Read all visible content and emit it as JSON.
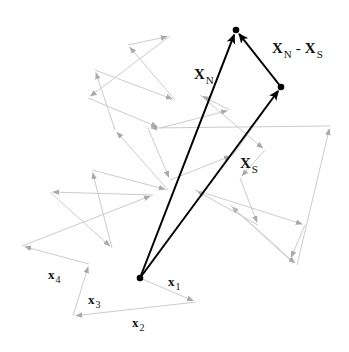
{
  "diagram": {
    "title": "",
    "colors": {
      "walk_step": "#cccccc",
      "walk_arrowhead": "#aaaaaa",
      "vector": "#000000",
      "background": "#ffffff"
    },
    "points": {
      "origin": {
        "x": 140,
        "y": 278
      },
      "end_N": {
        "x": 236,
        "y": 30
      },
      "end_S": {
        "x": 281,
        "y": 87
      }
    },
    "vectors": [
      {
        "id": "X_N",
        "from": "origin",
        "to": "end_N"
      },
      {
        "id": "X_S",
        "from": "origin",
        "to": "end_S"
      },
      {
        "id": "X_N_minus_X_S",
        "from": "end_S",
        "to": "end_N"
      }
    ],
    "labels": {
      "X_N": {
        "main": "X",
        "sub": "N"
      },
      "X_S": {
        "main": "X",
        "sub": "S"
      },
      "diff": {
        "left_main": "X",
        "left_sub": "N",
        "op": "-",
        "right_main": "X",
        "right_sub": "S"
      },
      "x1": {
        "main": "x",
        "sub": "1"
      },
      "x2": {
        "main": "x",
        "sub": "2"
      },
      "x3": {
        "main": "x",
        "sub": "3"
      },
      "x4": {
        "main": "x",
        "sub": "4"
      }
    },
    "random_walk": [
      [
        140,
        278
      ],
      [
        196,
        302
      ],
      [
        73,
        316
      ],
      [
        89,
        264
      ],
      [
        22,
        246
      ],
      [
        153,
        195
      ],
      [
        50,
        192
      ],
      [
        112,
        248
      ],
      [
        92,
        170
      ],
      [
        168,
        190
      ],
      [
        115,
        130
      ],
      [
        95,
        70
      ],
      [
        175,
        100
      ],
      [
        128,
        45
      ],
      [
        170,
        36
      ],
      [
        88,
        98
      ],
      [
        160,
        128
      ],
      [
        230,
        110
      ],
      [
        200,
        95
      ],
      [
        265,
        150
      ],
      [
        240,
        178
      ],
      [
        258,
        225
      ],
      [
        195,
        190
      ],
      [
        305,
        225
      ],
      [
        290,
        260
      ],
      [
        230,
        205
      ],
      [
        297,
        265
      ],
      [
        330,
        126
      ],
      [
        148,
        128
      ],
      [
        170,
        180
      ],
      [
        233,
        155
      ],
      [
        281,
        87
      ]
    ]
  }
}
